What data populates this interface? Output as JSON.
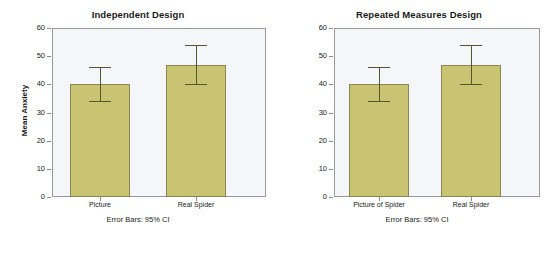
{
  "chart_data": [
    {
      "type": "bar",
      "panel": "left",
      "title": "Independent Design",
      "categories": [
        "Picture",
        "Real Spider"
      ],
      "values": [
        40,
        46.7
      ],
      "error_low": [
        34,
        40
      ],
      "error_high": [
        46,
        54
      ],
      "xlabel": "",
      "ylabel": "Mean Anxiety",
      "ylim": [
        0,
        60
      ],
      "yticks": [
        0,
        10,
        20,
        30,
        40,
        50,
        60
      ],
      "ytick_labels": [
        "0",
        "10",
        "20",
        "30",
        "40",
        "50",
        "60"
      ],
      "footnote": "Error Bars: 95% CI",
      "grid": false,
      "legend": "none",
      "bar_color": "#c8c471",
      "bar_edge_color": "#8a8752",
      "plot_bg": "#f5f6fa",
      "frame_color": "#9a9a9a",
      "error_color": "#57552e"
    },
    {
      "type": "bar",
      "panel": "right",
      "title": "Repeated Measures Design",
      "categories": [
        "Picture of Spider",
        "Real Spider"
      ],
      "values": [
        40,
        46.7
      ],
      "error_low": [
        34,
        40
      ],
      "error_high": [
        46,
        54
      ],
      "xlabel": "",
      "ylabel": "Mean",
      "ylim": [
        0,
        60
      ],
      "yticks": [
        0,
        10,
        20,
        30,
        40,
        50,
        60
      ],
      "ytick_labels": [
        "0",
        "10",
        "20",
        "30",
        "40",
        "50",
        "60"
      ],
      "footnote": "Error Bars: 95% CI",
      "grid": false,
      "legend": "none",
      "bar_color": "#c8c471",
      "bar_edge_color": "#8a8752",
      "plot_bg": "#f5f6fa",
      "frame_color": "#9a9a9a",
      "error_color": "#57552e"
    }
  ]
}
